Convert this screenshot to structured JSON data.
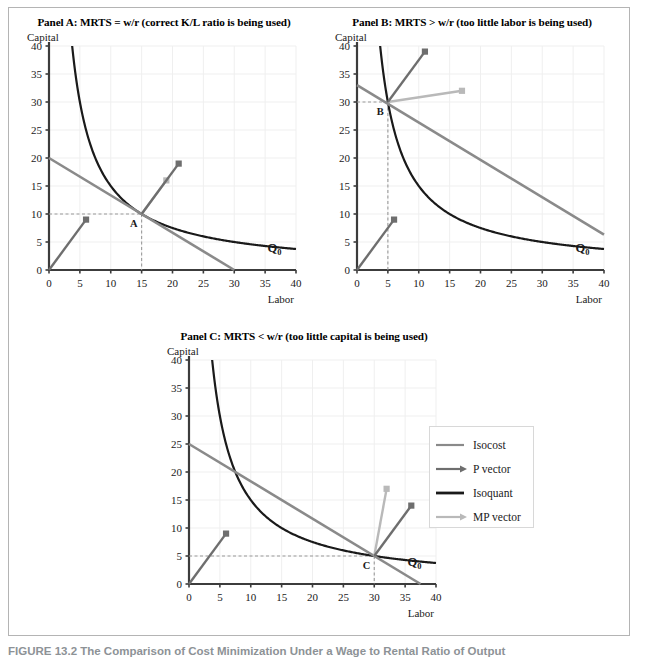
{
  "figure": {
    "caption": "FIGURE 13.2 The Comparison of Cost Minimization Under a Wage to Rental Ratio of Output",
    "border_color": "#b4b4b4"
  },
  "colors": {
    "isocost": "#8a8a8a",
    "p_vector": "#6e6e6e",
    "isoquant": "#1a1a1a",
    "mp_vector": "#b9b9b9",
    "axis": "#3c3c3c",
    "grid": "#efefef",
    "dashed": "#9a9a9a",
    "text": "#1a1a1a",
    "caption": "#8d9296"
  },
  "axes": {
    "x_label": "Labor",
    "y_label": "Capital",
    "x_ticks": [
      0,
      5,
      10,
      15,
      20,
      25,
      30,
      35,
      40
    ],
    "y_ticks": [
      0,
      5,
      10,
      15,
      20,
      25,
      30,
      35,
      40
    ],
    "xlim": [
      0,
      40
    ],
    "ylim": [
      0,
      40
    ],
    "isoquant_label": "Q",
    "isoquant_sublabel": "0"
  },
  "legend": {
    "position": "right-middle",
    "items": [
      {
        "label": "Isocost",
        "style": "line",
        "color": "#8a8a8a",
        "name": "isocost"
      },
      {
        "label": "P vector",
        "style": "arrow",
        "color": "#6e6e6e",
        "name": "p-vector"
      },
      {
        "label": "Isoquant",
        "style": "line",
        "color": "#1a1a1a",
        "name": "isoquant"
      },
      {
        "label": "MP vector",
        "style": "arrow",
        "color": "#b9b9b9",
        "name": "mp-vector"
      }
    ]
  },
  "chart_data": [
    {
      "id": "panel-a",
      "type": "line",
      "title": "Panel A: MRTS = w/r (correct K/L ratio is being used)",
      "xlabel": "Labor",
      "ylabel": "Capital",
      "xlim": [
        0,
        40
      ],
      "ylim": [
        0,
        40
      ],
      "grid": true,
      "isoquant": {
        "label": "Q0",
        "constant": 150,
        "x_start": 3.75,
        "x_end": 40,
        "y_cap": 40
      },
      "isocost": {
        "k_intercept": 20,
        "l_intercept": 30
      },
      "tangency": {
        "label": "A",
        "labor": 15,
        "capital": 10
      },
      "p_vector": {
        "from": [
          0,
          0
        ],
        "to": [
          6,
          9
        ]
      },
      "mp_vector": {
        "from": [
          15,
          10
        ],
        "to": [
          19,
          16
        ]
      },
      "extra_marker": {
        "at": [
          21,
          19
        ],
        "color": "#6e6e6e"
      },
      "isoquant_label_pos": [
        36.5,
        3.2
      ],
      "dashed_guides": {
        "capital": 10,
        "labor": 15
      }
    },
    {
      "id": "panel-b",
      "type": "line",
      "title": "Panel B: MRTS > w/r (too little labor is being used)",
      "xlabel": "Labor",
      "ylabel": "Capital",
      "xlim": [
        0,
        40
      ],
      "ylim": [
        0,
        40
      ],
      "grid": true,
      "isoquant": {
        "label": "Q0",
        "constant": 150,
        "x_start": 3.75,
        "x_end": 40,
        "y_cap": 40
      },
      "isocost": {
        "k_intercept": 33,
        "l_intercept": 49.5
      },
      "tangency": {
        "label": "B",
        "labor": 5,
        "capital": 30
      },
      "p_vector": {
        "from": [
          0,
          0
        ],
        "to": [
          6,
          9
        ]
      },
      "mp_vector": {
        "from": [
          5,
          30
        ],
        "to": [
          17,
          32
        ]
      },
      "extra_marker": {
        "at": [
          11,
          39
        ],
        "color": "#6e6e6e"
      },
      "isoquant_label_pos": [
        36.5,
        3.2
      ],
      "dashed_guides": {
        "capital": 30,
        "labor": 5
      }
    },
    {
      "id": "panel-c",
      "type": "line",
      "title": "Panel C: MRTS < w/r (too little capital is being used)",
      "xlabel": "Labor",
      "ylabel": "Capital",
      "xlim": [
        0,
        40
      ],
      "ylim": [
        0,
        40
      ],
      "grid": true,
      "isoquant": {
        "label": "Q0",
        "constant": 150,
        "x_start": 3.75,
        "x_end": 40,
        "y_cap": 40
      },
      "isocost": {
        "k_intercept": 25,
        "l_intercept": 37.5
      },
      "tangency": {
        "label": "C",
        "labor": 30,
        "capital": 5
      },
      "p_vector": {
        "from": [
          0,
          0
        ],
        "to": [
          6,
          9
        ]
      },
      "mp_vector": {
        "from": [
          30,
          5
        ],
        "to": [
          32,
          17
        ]
      },
      "extra_marker": {
        "at": [
          36,
          14
        ],
        "color": "#6e6e6e"
      },
      "isoquant_label_pos": [
        36.5,
        3.2
      ],
      "dashed_guides": {
        "capital": 5,
        "labor": 30
      }
    }
  ]
}
